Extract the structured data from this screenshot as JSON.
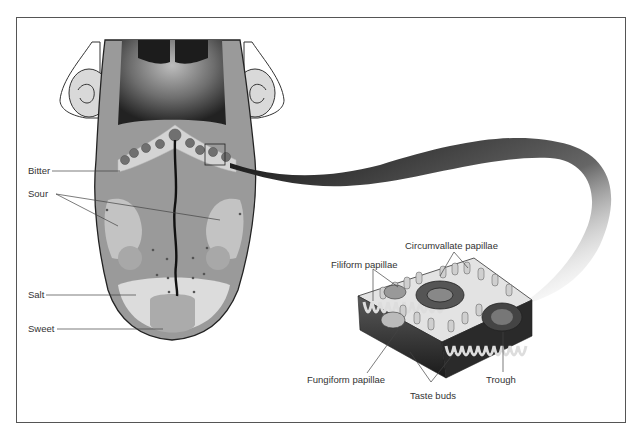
{
  "diagram": {
    "tongue_labels": [
      {
        "id": "bitter",
        "text": "Bitter"
      },
      {
        "id": "sour",
        "text": "Sour"
      },
      {
        "id": "salt",
        "text": "Salt"
      },
      {
        "id": "sweet",
        "text": "Sweet"
      }
    ],
    "inset_labels": [
      {
        "id": "circumvallate",
        "text": "Circumvallate papillae"
      },
      {
        "id": "filiform",
        "text": "Filiform papillae"
      },
      {
        "id": "fungiform",
        "text": "Fungiform papillae"
      },
      {
        "id": "trough",
        "text": "Trough"
      },
      {
        "id": "taste-buds",
        "text": "Taste buds"
      }
    ],
    "colors": {
      "frame": "#555555",
      "tongue_base": "#9a9a9a",
      "tongue_light": "#c8c8c8",
      "tongue_lighter": "#dcdcdc",
      "dark": "#1a1a1a",
      "papilla_dot": "#6a6a6a"
    }
  }
}
